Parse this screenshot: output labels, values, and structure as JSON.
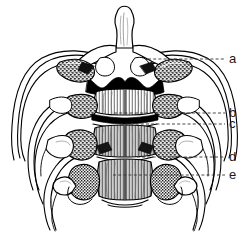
{
  "figure": {
    "background_color": "#ffffff",
    "ink_color": "#000000",
    "label_color": "#1a1a1a",
    "width": 249,
    "height": 232
  },
  "labels": [
    {
      "id": "a",
      "text": "a",
      "x": 229,
      "y": 52,
      "leader": {
        "x1": 148,
        "y1": 59,
        "x2": 225,
        "y2": 59
      }
    },
    {
      "id": "b",
      "text": "b",
      "x": 229,
      "y": 106,
      "leader": {
        "x1": 114,
        "y1": 113,
        "x2": 225,
        "y2": 113
      }
    },
    {
      "id": "c",
      "text": "c",
      "x": 229,
      "y": 117,
      "leader": {
        "x1": 120,
        "y1": 124,
        "x2": 225,
        "y2": 124
      }
    },
    {
      "id": "d",
      "text": "d",
      "x": 229,
      "y": 150,
      "leader": {
        "x1": 137,
        "y1": 157,
        "x2": 225,
        "y2": 157
      }
    },
    {
      "id": "e",
      "text": "e",
      "x": 229,
      "y": 168,
      "leader": {
        "x1": 113,
        "y1": 175,
        "x2": 225,
        "y2": 175
      }
    }
  ]
}
